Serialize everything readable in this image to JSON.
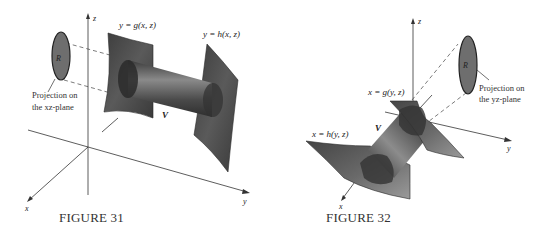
{
  "figure31": {
    "caption": "FIGURE 31",
    "axes": {
      "x": "x",
      "y": "y",
      "z": "z"
    },
    "surface_g_label": "y = g(x, z)",
    "surface_h_label": "y = h(x, z)",
    "volume_label": "V",
    "region_label": "R",
    "projection_label_line1": "Projection on",
    "projection_label_line2": "the xz-plane"
  },
  "figure32": {
    "caption": "FIGURE 32",
    "axes": {
      "x": "x",
      "y": "y",
      "z": "z"
    },
    "surface_g_label": "x = g(y, z)",
    "surface_h_label": "x = h(y, z)",
    "volume_label": "V",
    "region_label": "R",
    "projection_label_line1": "Projection on",
    "projection_label_line2": "the yz-plane"
  },
  "colors": {
    "surface": "#4a4a4a",
    "surface_light": "#7a7a7a",
    "region_fill": "#6e6e6e",
    "axis": "#333333",
    "background": "#ffffff"
  }
}
